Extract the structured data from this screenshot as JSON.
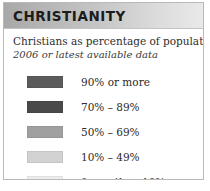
{
  "panel": {
    "title": "CHRISTIANITY",
    "subtitle_main": "Christians as percentage of population",
    "subtitle_note": "2006 or latest available data",
    "border_color": "#b9b9b9",
    "header_gradient_start": "#a8a8a8",
    "header_gradient_end": "#e9e9e9"
  },
  "legend": {
    "items": [
      {
        "label": "90% or more",
        "color": "#5b5b5b"
      },
      {
        "label": "70% – 89%",
        "color": "#4a4a4a"
      },
      {
        "label": "50% – 69%",
        "color": "#a0a0a0"
      },
      {
        "label": "10% – 49%",
        "color": "#d2d2d2"
      },
      {
        "label": "fewer than 10%",
        "color": "#ededed"
      }
    ]
  }
}
